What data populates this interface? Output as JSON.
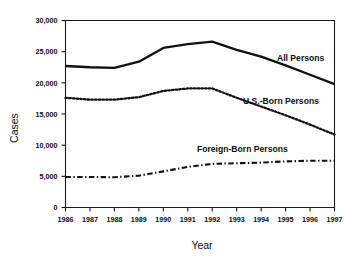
{
  "chart_data": {
    "type": "line",
    "title": "",
    "xlabel": "Year",
    "ylabel": "Cases",
    "x": [
      1986,
      1987,
      1988,
      1989,
      1990,
      1991,
      1992,
      1993,
      1994,
      1995,
      1996,
      1997
    ],
    "categories": [
      "1986",
      "1987",
      "1988",
      "1989",
      "1990",
      "1991",
      "1992",
      "1993",
      "1994",
      "1995",
      "1996",
      "1997"
    ],
    "xlim": [
      1986,
      1997
    ],
    "ylim": [
      0,
      30000
    ],
    "yticks": [
      0,
      5000,
      10000,
      15000,
      20000,
      25000,
      30000
    ],
    "ytick_labels": [
      "0",
      "5,000",
      "10,000",
      "15,000",
      "20,000",
      "25,000",
      "30,000"
    ],
    "grid": false,
    "legend_position": "inline-annotation",
    "series": [
      {
        "name": "All Persons",
        "style": "solid",
        "color": "#111111",
        "values": [
          22700,
          22500,
          22400,
          23400,
          25600,
          26200,
          26600,
          25300,
          24200,
          22800,
          21300,
          19800
        ]
      },
      {
        "name": "U.S.-Born Persons",
        "style": "dotted",
        "color": "#111111",
        "values": [
          17600,
          17300,
          17300,
          17700,
          18700,
          19100,
          19100,
          17600,
          16200,
          14800,
          13300,
          11700
        ]
      },
      {
        "name": "Foreign-Born Persons",
        "style": "dash-dot",
        "color": "#111111",
        "values": [
          4900,
          4900,
          4850,
          5100,
          5800,
          6500,
          7000,
          7100,
          7200,
          7400,
          7500,
          7500
        ]
      }
    ],
    "annotations": [
      {
        "text": "All Persons",
        "series": "All Persons",
        "x": 277,
        "y": 61
      },
      {
        "text": "U.S.-Born Persons",
        "series": "U.S.-Born Persons",
        "x": 243,
        "y": 104
      },
      {
        "text": "Foreign-Born Persons",
        "series": "Foreign-Born Persons",
        "x": 197,
        "y": 152
      }
    ]
  }
}
